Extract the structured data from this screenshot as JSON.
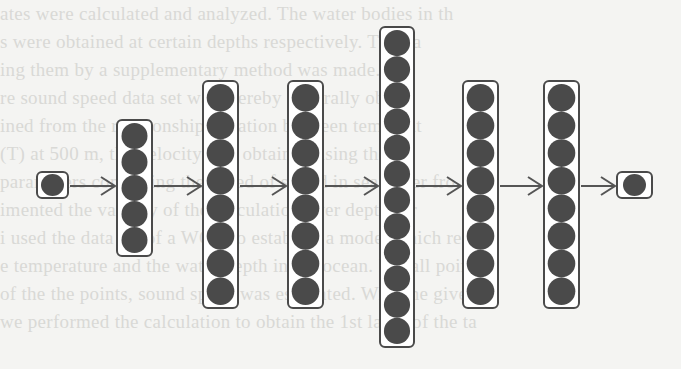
{
  "figure": {
    "layers": [
      {
        "name": "input",
        "nodes": 1,
        "box": {
          "x": 37,
          "y": 172,
          "w": 31,
          "h": 26
        }
      },
      {
        "name": "hidden-1",
        "nodes": 5,
        "box": {
          "x": 117,
          "y": 120,
          "w": 35,
          "h": 136
        }
      },
      {
        "name": "hidden-2",
        "nodes": 8,
        "box": {
          "x": 203,
          "y": 81,
          "w": 35,
          "h": 227
        }
      },
      {
        "name": "hidden-3",
        "nodes": 8,
        "box": {
          "x": 288,
          "y": 81,
          "w": 35,
          "h": 227
        }
      },
      {
        "name": "hidden-4",
        "nodes": 12,
        "box": {
          "x": 380,
          "y": 27,
          "w": 34,
          "h": 320
        }
      },
      {
        "name": "hidden-5",
        "nodes": 8,
        "box": {
          "x": 463,
          "y": 81,
          "w": 35,
          "h": 227
        }
      },
      {
        "name": "hidden-6",
        "nodes": 8,
        "box": {
          "x": 544,
          "y": 81,
          "w": 35,
          "h": 227
        }
      },
      {
        "name": "output",
        "nodes": 1,
        "box": {
          "x": 617,
          "y": 172,
          "w": 35,
          "h": 26
        }
      }
    ],
    "arrow_y": 186,
    "colors": {
      "node_fill": "#4a4a4a",
      "box_stroke": "#4a4a4a",
      "arrow": "#555555",
      "background": "#f4f4f2",
      "faded_text": "#d9d9d6"
    }
  },
  "background_text": {
    "lines": [
      "ates were calculated and analyzed. The water bodies in th",
      "s were obtained at certain depths respectively. The da",
      "ing them by a supplementary method was made. Fra",
      "re sound speed data set was thereby generally obt",
      "ined from the relationship equation between temperat",
      "(T) at 500 m, the velocity was obtained using the",
      "parameters computing the speed of sound in sea water fro",
      "imented the validity of the calculation over depth for",
      "i used the data set of a WOA to establish a model which re",
      "e temperature and the water depth in the ocean. For all points",
      "of the the points, sound speed was estimated. With the given d",
      "we performed the calculation to obtain the 1st layer of the ta"
    ]
  }
}
